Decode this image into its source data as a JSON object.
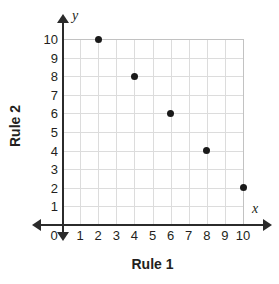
{
  "chart_data": {
    "type": "scatter",
    "title": "",
    "xlabel": "Rule 1",
    "ylabel": "Rule 2",
    "x_axis_symbol": "x",
    "y_axis_symbol": "y",
    "xlim": [
      0,
      10
    ],
    "ylim": [
      0,
      10
    ],
    "grid": true,
    "legend": "none",
    "x_ticks": [
      "0",
      "1",
      "2",
      "3",
      "4",
      "5",
      "6",
      "7",
      "8",
      "9",
      "10"
    ],
    "y_ticks": [
      "1",
      "2",
      "3",
      "4",
      "5",
      "6",
      "7",
      "8",
      "9",
      "10"
    ],
    "x": [
      2,
      4,
      6,
      8,
      10
    ],
    "values": [
      10,
      8,
      6,
      4,
      2
    ],
    "points": [
      {
        "x": 2,
        "y": 10
      },
      {
        "x": 4,
        "y": 8
      },
      {
        "x": 6,
        "y": 6
      },
      {
        "x": 8,
        "y": 4
      },
      {
        "x": 10,
        "y": 2
      }
    ],
    "point_color": "#1a1a1a",
    "grid_color": "#dcdcdc",
    "axis_color": "#2b2b2b"
  }
}
